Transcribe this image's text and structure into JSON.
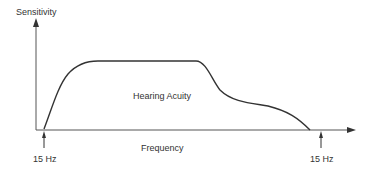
{
  "diagram": {
    "y_axis_label": "Sensitivity",
    "x_axis_label": "Frequency",
    "curve_label": "Hearing Acuity",
    "left_marker_label": "15 Hz",
    "right_marker_label": "15 Hz",
    "colors": {
      "line": "#333333",
      "axis": "#555555",
      "text": "#333333"
    }
  }
}
